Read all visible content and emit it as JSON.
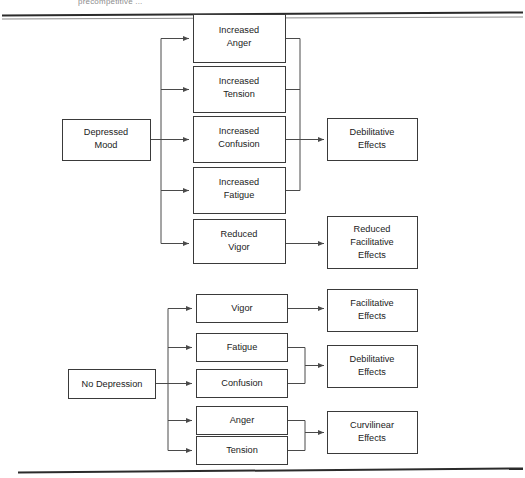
{
  "page": {
    "header_fragment": "precompetitive ...",
    "background_color": "#ffffff",
    "line_color": "#4a4a4a",
    "box_border_color": "#3a3a3a",
    "text_color": "#1b1b1b"
  },
  "diagram": {
    "type": "flowchart",
    "title": "",
    "models": [
      {
        "name": "depressed-mood-model",
        "source": {
          "label": "Depressed Mood",
          "lines": [
            "Depressed",
            "Mood"
          ]
        },
        "mediators": [
          {
            "label": "Increased Anger",
            "lines": [
              "Increased",
              "Anger"
            ]
          },
          {
            "label": "Increased Tension",
            "lines": [
              "Increased",
              "Tension"
            ]
          },
          {
            "label": "Increased Confusion",
            "lines": [
              "Increased",
              "Confusion"
            ]
          },
          {
            "label": "Increased Fatigue",
            "lines": [
              "Increased",
              "Fatigue"
            ]
          },
          {
            "label": "Reduced Vigor",
            "lines": [
              "Reduced",
              "Vigor"
            ]
          }
        ],
        "outcomes": [
          {
            "label": "Debilitative Effects",
            "lines": [
              "Debilitative",
              "Effects"
            ]
          },
          {
            "label": "Reduced Facilitative Effects",
            "lines": [
              "Reduced",
              "Facilitative",
              "Effects"
            ]
          }
        ]
      },
      {
        "name": "no-depression-model",
        "source": {
          "label": "No Depression",
          "lines": [
            "No Depression"
          ]
        },
        "mediators": [
          {
            "label": "Vigor",
            "lines": [
              "Vigor"
            ]
          },
          {
            "label": "Fatigue",
            "lines": [
              "Fatigue"
            ]
          },
          {
            "label": "Confusion",
            "lines": [
              "Confusion"
            ]
          },
          {
            "label": "Anger",
            "lines": [
              "Anger"
            ]
          },
          {
            "label": "Tension",
            "lines": [
              "Tension"
            ]
          }
        ],
        "outcomes": [
          {
            "label": "Facilitative Effects",
            "lines": [
              "Facilitative",
              "Effects"
            ]
          },
          {
            "label": "Debilitative Effects",
            "lines": [
              "Debilitative",
              "Effects"
            ]
          },
          {
            "label": "Curvilinear Effects",
            "lines": [
              "Curvilinear",
              "Effects"
            ]
          }
        ]
      }
    ]
  }
}
